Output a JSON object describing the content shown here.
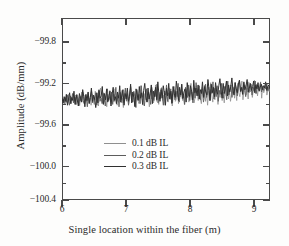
{
  "figure": {
    "background": "#fdfdfc",
    "axis_color": "#4a4a4a"
  },
  "chart_data": {
    "type": "line",
    "title": "",
    "subtitle": "",
    "xlabel": "Single location within the fiber (m)",
    "ylabel": "Amplitude (dB/mm)",
    "xlim": [
      6,
      9.25
    ],
    "ylim": [
      -100.4,
      -99.8
    ],
    "xticks": [
      6,
      7,
      8,
      9
    ],
    "xtick_labels": [
      "6",
      "7",
      "8",
      "9"
    ],
    "yticks": [
      -99.8,
      -99.2,
      -99.6,
      -100.0,
      -100.4
    ],
    "ytick_labels": [
      "−99.8",
      "−99.2",
      "−99.6",
      "−100.0",
      "−100.4"
    ],
    "grid": false,
    "minor_ticks": true,
    "legend_position": "center-left-inside",
    "legend": [
      "0.1 dB IL",
      "0.2 dB IL",
      "0.3 dB IL"
    ],
    "series": [
      {
        "name": "0.1 dB IL",
        "color": "#8f8f8f",
        "linewidth": 0.8,
        "values": [
          -99.37,
          -99.4,
          -99.36,
          -99.43,
          -99.35,
          -99.41,
          -99.3,
          -99.38,
          -99.33,
          -99.42,
          -99.36,
          -99.29,
          -99.39,
          -99.34,
          -99.43,
          -99.31,
          -99.38,
          -99.44,
          -99.32,
          -99.4,
          -99.27,
          -99.36,
          -99.42,
          -99.33,
          -99.39,
          -99.28,
          -99.41,
          -99.35,
          -99.44,
          -99.3,
          -99.37,
          -99.43,
          -99.26,
          -99.38,
          -99.34,
          -99.45,
          -99.31,
          -99.22,
          -99.36,
          -99.41,
          -99.28,
          -99.39,
          -99.33,
          -99.46,
          -99.3,
          -99.37,
          -99.25,
          -99.42,
          -99.34,
          -99.29,
          -99.4,
          -99.23,
          -99.36,
          -99.44,
          -99.31,
          -99.38,
          -99.27,
          -99.41,
          -99.35,
          -99.47,
          -99.32,
          -99.24,
          -99.39,
          -99.3,
          -99.43,
          -99.36,
          -99.21,
          -99.34,
          -99.4,
          -99.28,
          -99.45,
          -99.33,
          -99.26,
          -99.38,
          -99.42,
          -99.31,
          -99.19,
          -99.35,
          -99.44,
          -99.29,
          -99.37,
          -99.23,
          -99.4,
          -99.32,
          -99.46,
          -99.28,
          -99.36,
          -99.25,
          -99.41,
          -99.33,
          -99.18,
          -99.39,
          -99.3,
          -99.43,
          -99.27,
          -99.35,
          -99.21,
          -99.38,
          -99.31,
          -99.44,
          -99.26,
          -99.34,
          -99.4,
          -99.22,
          -99.37,
          -99.29,
          -99.45,
          -99.32,
          -99.24,
          -99.39,
          -99.36,
          -99.2,
          -99.42,
          -99.28,
          -99.33,
          -99.17,
          -99.38,
          -99.3,
          -99.43,
          -99.25,
          -99.35,
          -99.22,
          -99.4,
          -99.31,
          -99.16,
          -99.37,
          -99.27,
          -99.41,
          -99.34,
          -99.19,
          -99.29,
          -99.38,
          -99.24,
          -99.36,
          -99.42,
          -99.21,
          -99.33,
          -99.18,
          -99.39,
          -99.28,
          -99.44,
          -99.26,
          -99.35,
          -99.15,
          -99.31,
          -99.4,
          -99.23,
          -99.37,
          -99.2,
          -99.29,
          -99.43,
          -99.25,
          -99.34,
          -99.17,
          -99.38,
          -99.27,
          -99.41,
          -99.22,
          -99.32,
          -99.14,
          -99.36,
          -99.24,
          -99.39,
          -99.3,
          -99.19,
          -99.26,
          -99.35,
          -99.21,
          -99.38,
          -99.16,
          -99.28,
          -99.33,
          -99.23,
          -99.13,
          -99.37,
          -99.25,
          -99.18,
          -99.31,
          -99.22,
          -99.36,
          -99.15,
          -99.27,
          -99.2,
          -99.34,
          -99.24,
          -99.12,
          -99.29,
          -99.17,
          -99.32,
          -99.21,
          -99.26,
          -99.14,
          -99.35,
          -99.19,
          -99.28,
          -99.23,
          -99.16,
          -99.31,
          -99.25,
          -99.18,
          -99.27
        ]
      },
      {
        "name": "0.2 dB IL",
        "color": "#5c5c5c",
        "linewidth": 0.9,
        "values": [
          -99.39,
          -99.36,
          -99.42,
          -99.34,
          -99.4,
          -99.31,
          -99.37,
          -99.44,
          -99.32,
          -99.38,
          -99.29,
          -99.41,
          -99.35,
          -99.43,
          -99.3,
          -99.36,
          -99.45,
          -99.33,
          -99.39,
          -99.27,
          -99.38,
          -99.42,
          -99.31,
          -99.35,
          -99.46,
          -99.3,
          -99.4,
          -99.34,
          -99.26,
          -99.41,
          -99.33,
          -99.37,
          -99.28,
          -99.44,
          -99.32,
          -99.24,
          -99.39,
          -99.35,
          -99.42,
          -99.29,
          -99.36,
          -99.45,
          -99.31,
          -99.23,
          -99.38,
          -99.33,
          -99.4,
          -99.27,
          -99.43,
          -99.3,
          -99.35,
          -99.21,
          -99.39,
          -99.32,
          -99.46,
          -99.28,
          -99.37,
          -99.25,
          -99.41,
          -99.34,
          -99.22,
          -99.38,
          -99.29,
          -99.44,
          -99.31,
          -99.2,
          -99.36,
          -99.4,
          -99.26,
          -99.33,
          -99.47,
          -99.24,
          -99.37,
          -99.3,
          -99.42,
          -99.19,
          -99.34,
          -99.28,
          -99.45,
          -99.32,
          -99.23,
          -99.39,
          -99.27,
          -99.35,
          -99.43,
          -99.21,
          -99.3,
          -99.38,
          -99.25,
          -99.33,
          -99.17,
          -99.41,
          -99.29,
          -99.36,
          -99.22,
          -99.34,
          -99.44,
          -99.26,
          -99.31,
          -99.18,
          -99.39,
          -99.28,
          -99.35,
          -99.23,
          -99.42,
          -99.3,
          -99.2,
          -99.37,
          -99.26,
          -99.33,
          -99.16,
          -99.4,
          -99.29,
          -99.24,
          -99.36,
          -99.31,
          -99.43,
          -99.21,
          -99.27,
          -99.34,
          -99.18,
          -99.38,
          -99.25,
          -99.3,
          -99.41,
          -99.22,
          -99.35,
          -99.15,
          -99.28,
          -99.32,
          -99.19,
          -99.37,
          -99.26,
          -99.23,
          -99.4,
          -99.31,
          -99.17,
          -99.34,
          -99.27,
          -99.21,
          -99.38,
          -99.24,
          -99.29,
          -99.14,
          -99.36,
          -99.22,
          -99.33,
          -99.19,
          -99.39,
          -99.25,
          -99.3,
          -99.16,
          -99.28,
          -99.35,
          -99.2,
          -99.23,
          -99.37,
          -99.13,
          -99.31,
          -99.26,
          -99.18,
          -99.34,
          -99.21,
          -99.29,
          -99.15,
          -99.24,
          -99.32,
          -99.19,
          -99.12,
          -99.27,
          -99.22,
          -99.3,
          -99.16,
          -99.25,
          -99.33,
          -99.2,
          -99.14,
          -99.28,
          -99.23,
          -99.17,
          -99.31,
          -99.21,
          -99.26,
          -99.13,
          -99.29,
          -99.18,
          -99.24,
          -99.22,
          -99.15,
          -99.27,
          -99.2,
          -99.25,
          -99.19,
          -99.23,
          -99.16,
          -99.26,
          -99.21,
          -99.24
        ]
      },
      {
        "name": "0.3 dB IL",
        "color": "#303030",
        "linewidth": 1.0,
        "values": [
          -99.35,
          -99.41,
          -99.33,
          -99.39,
          -99.3,
          -99.44,
          -99.36,
          -99.28,
          -99.42,
          -99.34,
          -99.38,
          -99.26,
          -99.43,
          -99.31,
          -99.37,
          -99.45,
          -99.29,
          -99.35,
          -99.4,
          -99.24,
          -99.33,
          -99.46,
          -99.3,
          -99.38,
          -99.27,
          -99.42,
          -99.34,
          -99.22,
          -99.39,
          -99.31,
          -99.36,
          -99.47,
          -99.28,
          -99.41,
          -99.25,
          -99.35,
          -99.32,
          -99.2,
          -99.43,
          -99.29,
          -99.37,
          -99.23,
          -99.4,
          -99.34,
          -99.26,
          -99.45,
          -99.3,
          -99.21,
          -99.38,
          -99.33,
          -99.42,
          -99.27,
          -99.35,
          -99.19,
          -99.4,
          -99.31,
          -99.24,
          -99.44,
          -99.29,
          -99.36,
          -99.22,
          -99.39,
          -99.33,
          -99.17,
          -99.41,
          -99.27,
          -99.34,
          -99.46,
          -99.23,
          -99.3,
          -99.38,
          -99.2,
          -99.35,
          -99.28,
          -99.43,
          -99.25,
          -99.16,
          -99.32,
          -99.4,
          -99.22,
          -99.36,
          -99.29,
          -99.18,
          -99.42,
          -99.26,
          -99.33,
          -99.21,
          -99.37,
          -99.14,
          -99.3,
          -99.39,
          -99.24,
          -99.35,
          -99.19,
          -99.28,
          -99.44,
          -99.22,
          -99.32,
          -99.16,
          -99.36,
          -99.26,
          -99.41,
          -99.2,
          -99.29,
          -99.34,
          -99.13,
          -99.25,
          -99.38,
          -99.21,
          -99.31,
          -99.17,
          -99.35,
          -99.27,
          -99.23,
          -99.4,
          -99.15,
          -99.3,
          -99.33,
          -99.19,
          -99.26,
          -99.37,
          -99.12,
          -99.28,
          -99.22,
          -99.32,
          -99.18,
          -99.36,
          -99.24,
          -99.29,
          -99.14,
          -99.34,
          -99.2,
          -99.27,
          -99.31,
          -99.11,
          -99.23,
          -99.38,
          -99.17,
          -99.28,
          -99.21,
          -99.33,
          -99.15,
          -99.26,
          -99.3,
          -99.19,
          -99.1,
          -99.24,
          -99.35,
          -99.16,
          -99.29,
          -99.22,
          -99.13,
          -99.32,
          -99.18,
          -99.27,
          -99.2,
          -99.09,
          -99.25,
          -99.31,
          -99.15,
          -99.23,
          -99.28,
          -99.17,
          -99.12,
          -99.26,
          -99.21,
          -99.3,
          -99.14,
          -99.24,
          -99.19,
          -99.11,
          -99.27,
          -99.22,
          -99.16,
          -99.25,
          -99.2,
          -99.13,
          -99.28,
          -99.18,
          -99.23,
          -99.15,
          -99.26,
          -99.21,
          -99.17,
          -99.24,
          -99.19,
          -99.22,
          -99.14,
          -99.25,
          -99.2,
          -99.18,
          -99.23
        ]
      }
    ]
  },
  "legend_items": [
    {
      "label": "0.1 dB IL",
      "color": "#8f8f8f"
    },
    {
      "label": "0.2 dB IL",
      "color": "#5c5c5c"
    },
    {
      "label": "0.3 dB IL",
      "color": "#303030"
    }
  ]
}
